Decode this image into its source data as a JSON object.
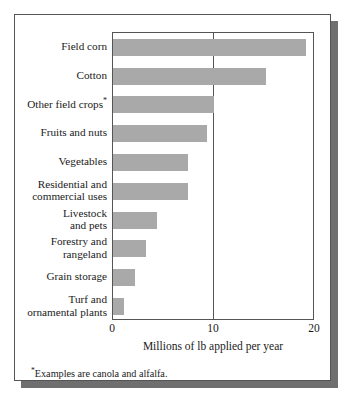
{
  "chart_data": {
    "type": "bar",
    "orientation": "horizontal",
    "title": "",
    "xlabel": "Millions of lb applied per year",
    "ylabel": "",
    "xlim": [
      0,
      20
    ],
    "xticks": [
      0,
      10,
      20
    ],
    "xtick_labels": [
      "0",
      "10",
      "20"
    ],
    "grid": "single vertical line at x = 10",
    "legend": "none",
    "categories": [
      "Field corn",
      "Cotton",
      "Other field crops*",
      "Fruits and nuts",
      "Vegetables",
      "Residential and commercial uses",
      "Livestock and pets",
      "Forestry and rangeland",
      "Grain storage",
      "Turf and ornamental plants"
    ],
    "values": [
      19.1,
      15.1,
      10.0,
      9.3,
      7.4,
      7.4,
      4.4,
      3.3,
      2.2,
      1.1
    ],
    "bar_color": "#a9a9a9",
    "annotations": [
      "*Examples are canola and alfalfa."
    ]
  },
  "chart": {
    "axis_title": "Millions of lb applied per year",
    "footnote_marker": "*",
    "footnote_text": "Examples are canola and alfalfa.",
    "categories": [
      {
        "lines": [
          "Field corn"
        ],
        "marker": ""
      },
      {
        "lines": [
          "Cotton"
        ],
        "marker": ""
      },
      {
        "lines": [
          "Other field crops"
        ],
        "marker": "*"
      },
      {
        "lines": [
          "Fruits and nuts"
        ],
        "marker": ""
      },
      {
        "lines": [
          "Vegetables"
        ],
        "marker": ""
      },
      {
        "lines": [
          "Residential and",
          "commercial uses"
        ],
        "marker": ""
      },
      {
        "lines": [
          "Livestock",
          "and pets"
        ],
        "marker": ""
      },
      {
        "lines": [
          "Forestry and",
          "rangeland"
        ],
        "marker": ""
      },
      {
        "lines": [
          "Grain storage"
        ],
        "marker": ""
      },
      {
        "lines": [
          "Turf and",
          "ornamental plants"
        ],
        "marker": ""
      }
    ]
  }
}
